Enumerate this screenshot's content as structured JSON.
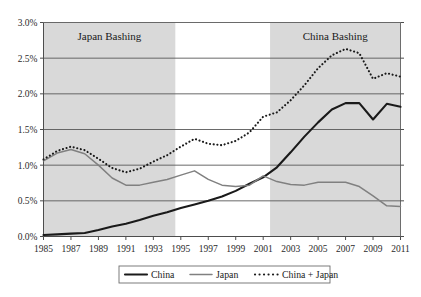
{
  "chart_data": {
    "type": "line",
    "title": "",
    "subtitle": "",
    "xlabel": "",
    "ylabel": "",
    "xlim": [
      1985,
      2011
    ],
    "ylim": [
      0.0,
      3.0
    ],
    "y_tick_format": "percent",
    "grid": true,
    "legend_position": "bottom",
    "y_ticks": [
      "0.0%",
      "0.5%",
      "1.0%",
      "1.5%",
      "2.0%",
      "2.5%",
      "3.0%"
    ],
    "y_tick_values": [
      0.0,
      0.5,
      1.0,
      1.5,
      2.0,
      2.5,
      3.0
    ],
    "x_tick_labels": [
      "1985",
      "1987",
      "1989",
      "1991",
      "1993",
      "1995",
      "1997",
      "1999",
      "2001",
      "2003",
      "2005",
      "2007",
      "2009",
      "2011"
    ],
    "x_tick_values": [
      1985,
      1987,
      1989,
      1991,
      1993,
      1995,
      1997,
      1999,
      2001,
      2003,
      2005,
      2007,
      2009,
      2011
    ],
    "x": [
      1985,
      1986,
      1987,
      1988,
      1989,
      1990,
      1991,
      1992,
      1993,
      1994,
      1995,
      1996,
      1997,
      1998,
      1999,
      2000,
      2001,
      2002,
      2003,
      2004,
      2005,
      2006,
      2007,
      2008,
      2009,
      2010,
      2011
    ],
    "series": [
      {
        "name": "China",
        "color": "#1a1a1a",
        "style": "solid",
        "width": 2.1,
        "values": [
          0.02,
          0.03,
          0.04,
          0.05,
          0.09,
          0.14,
          0.18,
          0.23,
          0.29,
          0.34,
          0.4,
          0.45,
          0.5,
          0.56,
          0.64,
          0.74,
          0.83,
          0.97,
          1.18,
          1.4,
          1.6,
          1.78,
          1.87,
          1.87,
          1.64,
          1.86,
          1.82
        ]
      },
      {
        "name": "Japan",
        "color": "#808080",
        "style": "solid",
        "width": 1.5,
        "values": [
          1.06,
          1.17,
          1.22,
          1.16,
          1.0,
          0.82,
          0.72,
          0.72,
          0.76,
          0.8,
          0.86,
          0.92,
          0.8,
          0.72,
          0.7,
          0.72,
          0.85,
          0.77,
          0.73,
          0.72,
          0.76,
          0.76,
          0.76,
          0.7,
          0.57,
          0.43,
          0.42
        ]
      },
      {
        "name": "China + Japan",
        "color": "#1a1a1a",
        "style": "dotted",
        "width": 2.1,
        "values": [
          1.08,
          1.2,
          1.26,
          1.21,
          1.09,
          0.96,
          0.9,
          0.95,
          1.05,
          1.14,
          1.26,
          1.37,
          1.3,
          1.28,
          1.34,
          1.46,
          1.68,
          1.74,
          1.91,
          2.12,
          2.36,
          2.54,
          2.63,
          2.57,
          2.21,
          2.29,
          2.24
        ]
      }
    ],
    "annotations": [
      {
        "name": "japan-bashing-band",
        "label": "Japan Bashing",
        "x_start": 1985,
        "x_end": 1994.6,
        "shade": "#d9d9d9"
      },
      {
        "name": "china-bashing-band",
        "label": "China Bashing",
        "x_start": 2001.5,
        "x_end": 2011,
        "shade": "#d9d9d9"
      }
    ],
    "legend": [
      {
        "label": "China",
        "style": "solid",
        "color": "#1a1a1a",
        "width": 2.1
      },
      {
        "label": "Japan",
        "style": "solid",
        "color": "#808080",
        "width": 1.5
      },
      {
        "label": "China + Japan",
        "style": "dotted",
        "color": "#1a1a1a",
        "width": 2.1
      }
    ]
  },
  "colors": {
    "band_shade": "#d9d9d9",
    "gridline": "#595959",
    "axis": "#4d4d4d",
    "china": "#1a1a1a",
    "japan": "#808080",
    "combined": "#1a1a1a",
    "background": "#ffffff"
  }
}
